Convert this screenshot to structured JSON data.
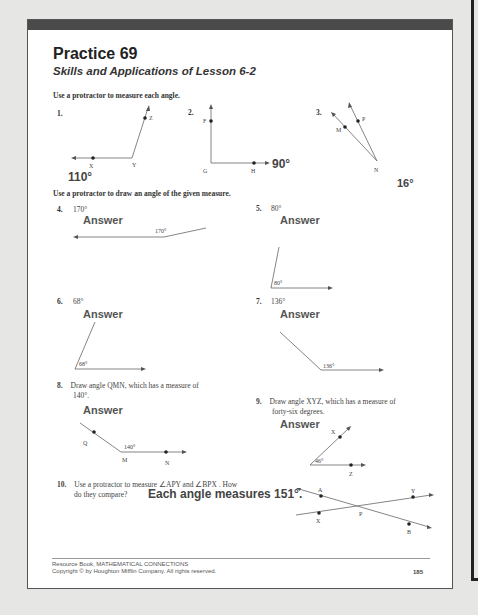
{
  "worksheet": {
    "title": "Practice 69",
    "subtitle": "Skills and Applications of Lesson 6-2",
    "section1": {
      "instruction": "Use a protractor to measure each angle.",
      "problems": [
        {
          "number": "1.",
          "points": [
            "X",
            "Y",
            "Z"
          ],
          "answer": "110°"
        },
        {
          "number": "2.",
          "points": [
            "F",
            "G",
            "H"
          ],
          "answer": "90°"
        },
        {
          "number": "3.",
          "points": [
            "M",
            "N",
            "P"
          ],
          "answer": "16°"
        }
      ]
    },
    "section2": {
      "instruction": "Use a protractor to draw an angle of the given measure.",
      "answer_label": "Answer",
      "problems": [
        {
          "number": "4.",
          "measure": "170°",
          "angle_label": "170°"
        },
        {
          "number": "5.",
          "measure": "80°",
          "angle_label": "80°"
        },
        {
          "number": "6.",
          "measure": "68°",
          "angle_label": "68°"
        },
        {
          "number": "7.",
          "measure": "136°",
          "angle_label": "136°"
        },
        {
          "number": "8.",
          "text_line1": "Draw angle QMN, which has a measure of",
          "text_line2": "140°.",
          "angle_label": "140°",
          "points": [
            "Q",
            "M",
            "N"
          ]
        },
        {
          "number": "9.",
          "text_line1": "Draw angle XYZ, which has a measure of",
          "text_line2": "forty-six degrees.",
          "angle_label": "46°",
          "points": [
            "X",
            "Y",
            "Z"
          ]
        }
      ]
    },
    "problem10": {
      "number": "10.",
      "text_line1": "Use a protractor to measure ∠APY and ∠BPX . How",
      "text_line2": "do they compare?",
      "answer": "Each angle measures 151°.",
      "points": [
        "A",
        "Y",
        "P",
        "X",
        "B"
      ]
    },
    "footer": {
      "line1": "Resource Book, MATHEMATICAL CONNECTIONS",
      "line2": "Copyright © by Houghton Mifflin Company.  All rights reserved.",
      "page_number": "185"
    }
  }
}
